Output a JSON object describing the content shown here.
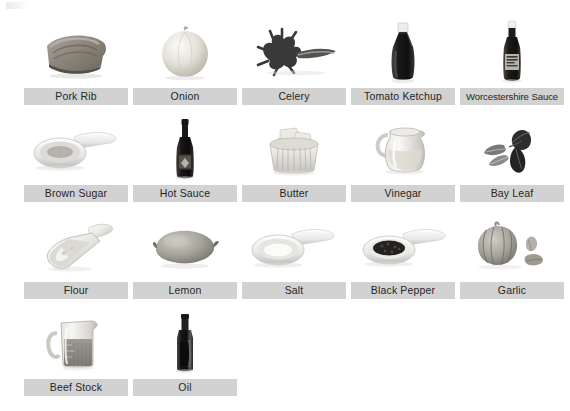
{
  "page": {
    "background_color": "#ffffff",
    "caption_background_color": "#d2d2d2",
    "caption_text_color": "#262626",
    "columns": 5,
    "rows": 4
  },
  "items": [
    {
      "label": "Pork Rib",
      "icon": "pork-rib-icon",
      "row": 1,
      "col": 1
    },
    {
      "label": "Onion",
      "icon": "onion-icon",
      "row": 1,
      "col": 2
    },
    {
      "label": "Celery",
      "icon": "celery-icon",
      "row": 1,
      "col": 3
    },
    {
      "label": "Tomato Ketchup",
      "icon": "ketchup-bottle-icon",
      "row": 1,
      "col": 4
    },
    {
      "label": "Worcestershire Sauce",
      "icon": "worcestershire-bottle-icon",
      "row": 1,
      "col": 5
    },
    {
      "label": "Brown Sugar",
      "icon": "brown-sugar-spoon-icon",
      "row": 2,
      "col": 1
    },
    {
      "label": "Hot Sauce",
      "icon": "hot-sauce-bottle-icon",
      "row": 2,
      "col": 2
    },
    {
      "label": "Butter",
      "icon": "butter-ramekin-icon",
      "row": 2,
      "col": 3
    },
    {
      "label": "Vinegar",
      "icon": "vinegar-pitcher-icon",
      "row": 2,
      "col": 4
    },
    {
      "label": "Bay Leaf",
      "icon": "bay-leaf-icon",
      "row": 2,
      "col": 5
    },
    {
      "label": "Flour",
      "icon": "flour-scoop-icon",
      "row": 3,
      "col": 1
    },
    {
      "label": "Lemon",
      "icon": "lemon-icon",
      "row": 3,
      "col": 2
    },
    {
      "label": "Salt",
      "icon": "salt-spoon-icon",
      "row": 3,
      "col": 3
    },
    {
      "label": "Black Pepper",
      "icon": "black-pepper-spoon-icon",
      "row": 3,
      "col": 4
    },
    {
      "label": "Garlic",
      "icon": "garlic-icon",
      "row": 3,
      "col": 5
    },
    {
      "label": "Beef Stock",
      "icon": "beef-stock-jug-icon",
      "row": 4,
      "col": 1
    },
    {
      "label": "Oil",
      "icon": "oil-bottle-icon",
      "row": 4,
      "col": 2
    }
  ]
}
